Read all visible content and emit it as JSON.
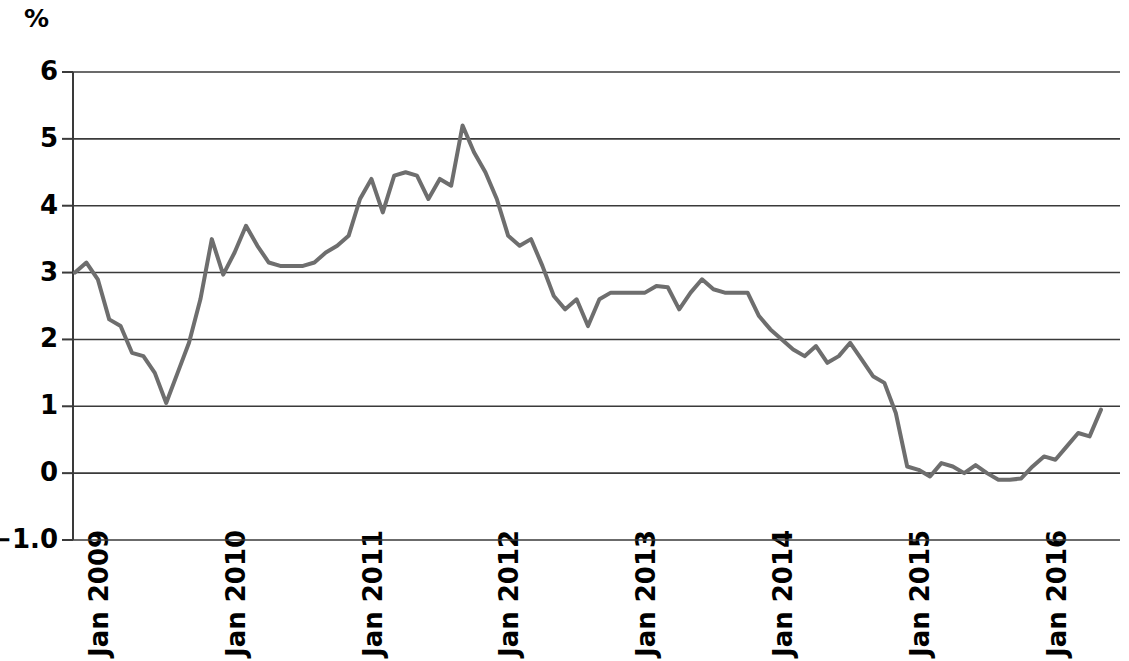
{
  "chart_data": {
    "type": "line",
    "title": "",
    "subtitle": "",
    "xlabel": "",
    "ylabel": "%",
    "unit_label": "%",
    "ylim": [
      -1.0,
      6.0
    ],
    "yticks": [
      6,
      5,
      4,
      3,
      2,
      1,
      0,
      -1.0
    ],
    "ytick_labels": [
      "6",
      "5",
      "4",
      "3",
      "2",
      "1",
      "0",
      "−1.0"
    ],
    "grid": true,
    "grid_axis": "y",
    "legend": "none",
    "line_color": "#6e6e6e",
    "axis_color": "#3a3a3a",
    "line_width": 4,
    "xtick_labels": [
      "Jan 2009",
      "Jan 2010",
      "Jan 2011",
      "Jan 2012",
      "Jan 2013",
      "Jan 2014",
      "Jan 2015",
      "Jan 2016"
    ],
    "xtick_values": [
      "2009-01",
      "2010-01",
      "2011-01",
      "2012-01",
      "2013-01",
      "2014-01",
      "2015-01",
      "2016-01"
    ],
    "x_start": "2009-01",
    "x_end": "2016-07",
    "series": [
      {
        "name": "Inflation rate",
        "x": [
          "2009-01",
          "2009-02",
          "2009-03",
          "2009-04",
          "2009-05",
          "2009-06",
          "2009-07",
          "2009-08",
          "2009-09",
          "2009-10",
          "2009-11",
          "2009-12",
          "2010-01",
          "2010-02",
          "2010-03",
          "2010-04",
          "2010-05",
          "2010-06",
          "2010-07",
          "2010-08",
          "2010-09",
          "2010-10",
          "2010-11",
          "2010-12",
          "2011-01",
          "2011-02",
          "2011-03",
          "2011-04",
          "2011-05",
          "2011-06",
          "2011-07",
          "2011-08",
          "2011-09",
          "2011-10",
          "2011-11",
          "2011-12",
          "2012-01",
          "2012-02",
          "2012-03",
          "2012-04",
          "2012-05",
          "2012-06",
          "2012-07",
          "2012-08",
          "2012-09",
          "2012-10",
          "2012-11",
          "2012-12",
          "2013-01",
          "2013-02",
          "2013-03",
          "2013-04",
          "2013-05",
          "2013-06",
          "2013-07",
          "2013-08",
          "2013-09",
          "2013-10",
          "2013-11",
          "2013-12",
          "2014-01",
          "2014-02",
          "2014-03",
          "2014-04",
          "2014-05",
          "2014-06",
          "2014-07",
          "2014-08",
          "2014-09",
          "2014-10",
          "2014-11",
          "2014-12",
          "2015-01",
          "2015-02",
          "2015-03",
          "2015-04",
          "2015-05",
          "2015-06",
          "2015-07",
          "2015-08",
          "2015-09",
          "2015-10",
          "2015-11",
          "2015-12",
          "2016-01",
          "2016-02",
          "2016-03",
          "2016-04",
          "2016-05",
          "2016-06",
          "2016-07"
        ],
        "values": [
          3.0,
          3.15,
          2.9,
          2.3,
          2.2,
          1.8,
          1.75,
          1.5,
          1.05,
          1.5,
          1.95,
          2.6,
          3.5,
          2.97,
          3.3,
          3.7,
          3.4,
          3.15,
          3.1,
          3.1,
          3.1,
          3.15,
          3.3,
          3.4,
          3.55,
          4.1,
          4.4,
          3.9,
          4.45,
          4.5,
          4.45,
          4.1,
          4.4,
          4.3,
          5.2,
          4.8,
          4.5,
          4.1,
          3.55,
          3.4,
          3.5,
          3.1,
          2.65,
          2.45,
          2.6,
          2.2,
          2.6,
          2.7,
          2.7,
          2.7,
          2.7,
          2.8,
          2.78,
          2.45,
          2.7,
          2.9,
          2.75,
          2.7,
          2.7,
          2.7,
          2.35,
          2.15,
          2.0,
          1.85,
          1.75,
          1.9,
          1.65,
          1.75,
          1.95,
          1.7,
          1.45,
          1.35,
          0.9,
          0.1,
          0.05,
          -0.05,
          0.15,
          0.1,
          0.0,
          0.12,
          0.0,
          -0.1,
          -0.1,
          -0.08,
          0.1,
          0.25,
          0.2,
          0.4,
          0.6,
          0.55,
          0.95
        ]
      }
    ],
    "annotations": [],
    "min_value": -0.1,
    "max_value": 5.2
  }
}
